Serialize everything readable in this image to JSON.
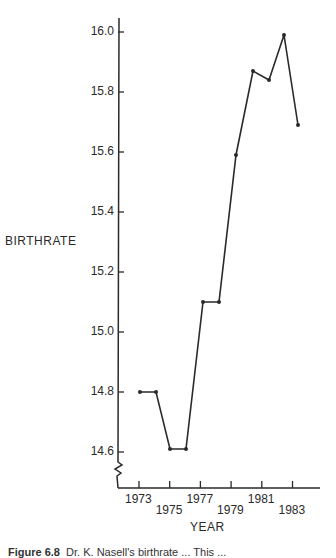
{
  "chart_data": {
    "type": "line",
    "title": "",
    "xlabel": "YEAR",
    "ylabel": "BIRTHRATE",
    "x": [
      1973,
      1974,
      1975,
      1976,
      1977,
      1978,
      1979,
      1980,
      1981,
      1982,
      1983
    ],
    "series": [
      {
        "name": "Birthrate",
        "values": [
          14.8,
          14.8,
          14.61,
          14.61,
          15.1,
          15.1,
          15.59,
          15.87,
          15.84,
          15.99,
          15.69
        ]
      }
    ],
    "x_tick_labels": [
      "1973",
      "1975",
      "1977",
      "1979",
      "1981",
      "1983"
    ],
    "y_tick_labels": [
      "14.6",
      "14.8",
      "15.0",
      "15.2",
      "15.4",
      "15.6",
      "15.8",
      "16.0"
    ],
    "ylim": [
      14.55,
      16.05
    ],
    "xlim": [
      1972,
      1984
    ],
    "grid": false,
    "legend": "none",
    "axis_break": "y-axis break below 14.6"
  },
  "caption": {
    "prefix": "Figure 6.8",
    "text": "Dr. K. Nasell's birthrate ... This ..."
  }
}
